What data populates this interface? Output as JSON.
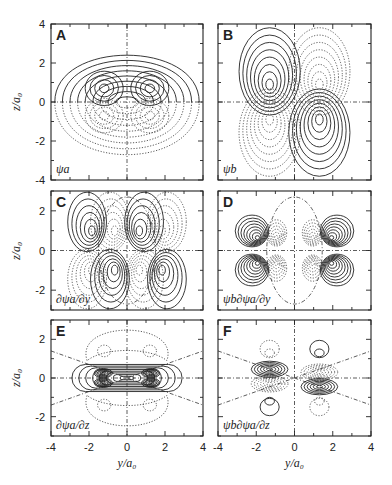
{
  "figure": {
    "y_axis_label": "z/a₀",
    "x_axis_label": "y/a₀",
    "x_ticks": [
      "-4",
      "-2",
      "0",
      "2",
      "4"
    ],
    "panels": [
      {
        "id": "A",
        "letter": "A",
        "func": "ψa",
        "z_ticks": [
          "4",
          "2",
          "0",
          "-2",
          "-4"
        ]
      },
      {
        "id": "B",
        "letter": "B",
        "func": "ψb"
      },
      {
        "id": "C",
        "letter": "C",
        "func": "∂ψa/∂y",
        "z_ticks": [
          "2",
          "0",
          "-2"
        ]
      },
      {
        "id": "D",
        "letter": "D",
        "func": "ψb∂ψa/∂y"
      },
      {
        "id": "E",
        "letter": "E",
        "func": "∂ψa/∂z",
        "z_ticks": [
          "2",
          "0",
          "-2"
        ]
      },
      {
        "id": "F",
        "letter": "F",
        "func": "ψb∂ψa/∂z"
      }
    ]
  },
  "chart_data": [
    {
      "type": "heatmap",
      "panel": "A",
      "title": "ψa",
      "xlabel": "y/a0",
      "ylabel": "z/a0",
      "xlim": [
        -4,
        4
      ],
      "ylim": [
        -4,
        4
      ],
      "description": "contour plot; solid=positive above z=0, dotted=negative below; two lobes centered at y=±1.2, z=±0.8",
      "x_ticks": [
        -4,
        -2,
        0,
        2,
        4
      ],
      "y_ticks": [
        -4,
        -2,
        0,
        2,
        4
      ]
    },
    {
      "type": "heatmap",
      "panel": "B",
      "title": "ψb",
      "xlabel": "y/a0",
      "ylabel": "z/a0",
      "xlim": [
        -4,
        4
      ],
      "ylim": [
        -4,
        4
      ],
      "description": "contour plot; solid lobes at (-1.2,+0.8) and (+1.2,-0.8); dotted lobes at (-1.2,-0.8) and (+1.2,+0.8)"
    },
    {
      "type": "heatmap",
      "panel": "C",
      "title": "∂ψa/∂y",
      "xlabel": "y/a0",
      "ylabel": "z/a0",
      "xlim": [
        -4,
        4
      ],
      "ylim": [
        -3,
        3
      ],
      "y_ticks": [
        -2,
        0,
        2
      ],
      "description": "four-lobed contours around y=±1.2 with a dash-dot elliptical nodal line"
    },
    {
      "type": "heatmap",
      "panel": "D",
      "title": "ψb∂ψa/∂y",
      "xlabel": "y/a0",
      "ylabel": "z/a0",
      "xlim": [
        -4,
        4
      ],
      "ylim": [
        -3,
        3
      ],
      "description": "solid outer lobes at |y|≈1.8, dotted inner lobes at |y|≈0.8, dash-dot ellipse nodal line"
    },
    {
      "type": "heatmap",
      "panel": "E",
      "title": "∂ψa/∂z",
      "xlabel": "y/a0",
      "ylabel": "z/a0",
      "xlim": [
        -4,
        4
      ],
      "ylim": [
        -3,
        3
      ],
      "y_ticks": [
        -2,
        0,
        2
      ],
      "description": "solid central band along z=0, dotted lobes above and below, dash-dot nodal lines"
    },
    {
      "type": "heatmap",
      "panel": "F",
      "title": "ψb∂ψa/∂z",
      "xlabel": "y/a0",
      "ylabel": "z/a0",
      "xlim": [
        -4,
        4
      ],
      "ylim": [
        -3,
        3
      ],
      "x_ticks": [
        -4,
        -2,
        0,
        2,
        4
      ],
      "description": "alternating solid/dotted stacked lobes at y=±1.2"
    }
  ]
}
